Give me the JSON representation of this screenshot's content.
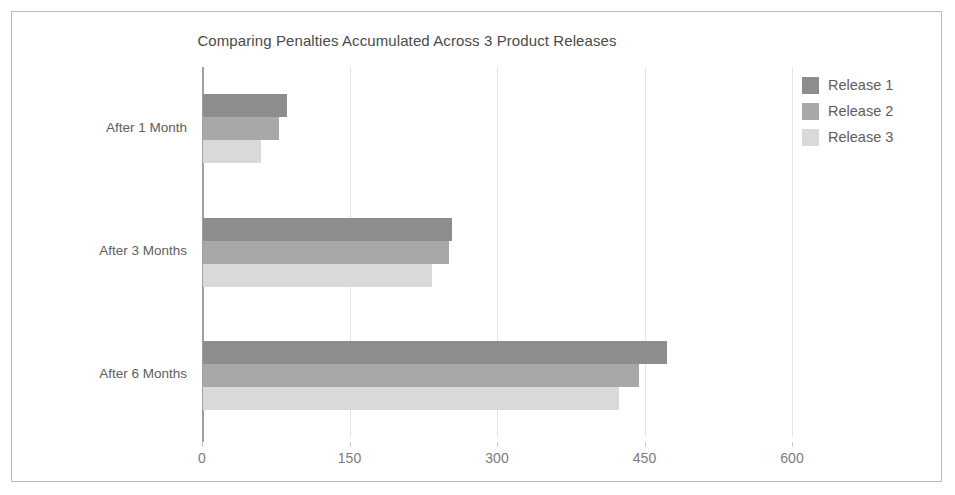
{
  "chart_data": {
    "type": "bar",
    "orientation": "horizontal",
    "title": "Comparing Penalties Accumulated Across 3 Product Releases",
    "xlabel": "",
    "ylabel": "",
    "categories": [
      "After 1 Month",
      "After 3 Months",
      "After 6 Months"
    ],
    "series": [
      {
        "name": "Release 1",
        "color": "#8d8d8d",
        "values": [
          85,
          253,
          472
        ]
      },
      {
        "name": "Release 2",
        "color": "#a8a8a8",
        "values": [
          77,
          250,
          443
        ]
      },
      {
        "name": "Release 3",
        "color": "#d9d9d9",
        "values": [
          59,
          233,
          423
        ]
      }
    ],
    "xticks": [
      0,
      150,
      300,
      450,
      600
    ],
    "xtick_labels": [
      "0",
      "150",
      "300",
      "450",
      "600"
    ],
    "xlim": [
      0,
      600
    ],
    "grid": true,
    "legend_position": "right",
    "legend_entries": [
      "Release 1",
      "Release 2",
      "Release 3"
    ]
  },
  "frame": {
    "border_color": "#b9b9b9",
    "background": "#ffffff"
  }
}
